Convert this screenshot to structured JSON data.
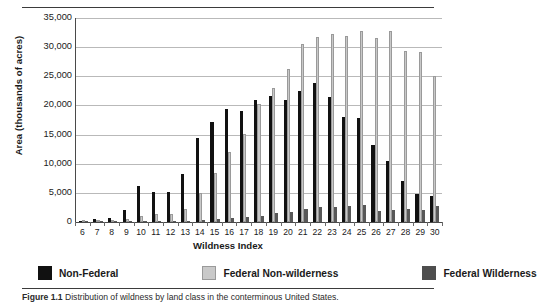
{
  "figure": {
    "caption_prefix": "Figure 1.1",
    "caption_text": "Distribution of wildness by land class in the conterminous United States."
  },
  "chart_data": {
    "type": "bar",
    "title": "",
    "xlabel": "Wildness Index",
    "ylabel": "Area (thousands of acres)",
    "categories": [
      "6",
      "7",
      "8",
      "9",
      "10",
      "11",
      "12",
      "13",
      "14",
      "15",
      "16",
      "17",
      "18",
      "19",
      "20",
      "21",
      "22",
      "23",
      "24",
      "25",
      "26",
      "27",
      "28",
      "29",
      "30"
    ],
    "series": [
      {
        "name": "Non-Federal",
        "color": "#111111",
        "values": [
          200,
          600,
          700,
          2000,
          6100,
          5100,
          5100,
          8300,
          14400,
          17200,
          19400,
          19000,
          20900,
          21700,
          20900,
          22500,
          23900,
          21400,
          18000,
          17900,
          13200,
          10400,
          7000,
          4800,
          4500
        ]
      },
      {
        "name": "Federal Non-wilderness",
        "color": "#c9c9c9",
        "values": [
          50,
          80,
          120,
          600,
          1100,
          1400,
          1450,
          2200,
          4900,
          8400,
          12000,
          15100,
          20300,
          23000,
          26200,
          30600,
          31800,
          32200,
          32000,
          32700,
          31500,
          32700,
          29400,
          29100,
          25000
        ]
      },
      {
        "name": "Federal Wilderness",
        "color": "#585858",
        "values": [
          10,
          20,
          30,
          60,
          120,
          150,
          180,
          250,
          350,
          500,
          700,
          900,
          1100,
          1500,
          1700,
          2300,
          2500,
          2600,
          2700,
          3000,
          1900,
          2000,
          2200,
          2100,
          2700
        ]
      }
    ],
    "ylim": [
      0,
      35000
    ],
    "yticks": [
      "0",
      "5,000",
      "10,000",
      "15,000",
      "20,000",
      "25,000",
      "30,000",
      "35,000"
    ],
    "ytick_values": [
      0,
      5000,
      10000,
      15000,
      20000,
      25000,
      30000,
      35000
    ],
    "grid": true,
    "legend_position": "bottom"
  }
}
